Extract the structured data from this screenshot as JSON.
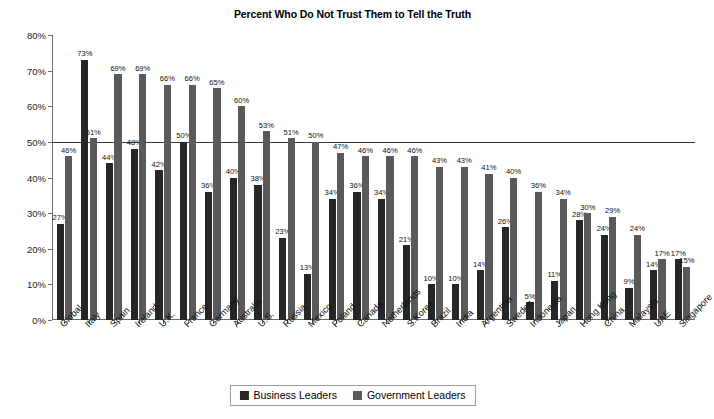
{
  "chart_data": {
    "type": "bar",
    "title": "Percent Who Do Not Trust Them to Tell the Truth",
    "xlabel": "",
    "ylabel": "",
    "ylim": [
      0,
      80
    ],
    "ytick_step": 10,
    "ytick_labels": [
      "0%",
      "10%",
      "20%",
      "30%",
      "40%",
      "50%",
      "60%",
      "70%",
      "80%"
    ],
    "grid": false,
    "reference_line": 50,
    "legend_position": "bottom",
    "value_suffix": "%",
    "categories": [
      "Global",
      "Italy",
      "Spain",
      "Ireland",
      "U.K.",
      "France",
      "Germany",
      "Australia",
      "U.S.",
      "Russia",
      "Mexico",
      "Poland",
      "Canada",
      "Netherlands",
      "S.Korea",
      "Brazil",
      "India",
      "Argentina",
      "Sweden",
      "Indonesia",
      "Japan",
      "Hong Kong",
      "China",
      "Malaysia",
      "UAE",
      "Singapore"
    ],
    "series": [
      {
        "name": "Business Leaders",
        "color": "#262626",
        "values": [
          27,
          73,
          44,
          48,
          42,
          50,
          36,
          40,
          38,
          23,
          13,
          34,
          36,
          34,
          21,
          10,
          10,
          14,
          26,
          5,
          11,
          28,
          24,
          9,
          14,
          17
        ]
      },
      {
        "name": "Government Leaders",
        "color": "#5a5a5a",
        "values": [
          46,
          51,
          69,
          69,
          66,
          66,
          65,
          60,
          53,
          51,
          50,
          47,
          46,
          46,
          46,
          43,
          43,
          41,
          40,
          36,
          34,
          30,
          29,
          24,
          17,
          15
        ]
      }
    ]
  },
  "legend": {
    "items": [
      {
        "label": "Business Leaders",
        "color": "#262626"
      },
      {
        "label": "Government Leaders",
        "color": "#5a5a5a"
      }
    ]
  }
}
